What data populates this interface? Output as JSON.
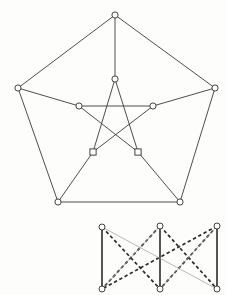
{
  "figure": {
    "background_color": "#fdfdfb",
    "colors": {
      "edge_solid": "#3a3a3a",
      "edge_heavy": "#2b2b2b",
      "edge_dashed": "#2b2b2b",
      "edge_faint": "#9a9a9a",
      "node_fill": "#ffffff",
      "node_stroke": "#2f2f2f"
    }
  },
  "petersen_graph": {
    "name": "petersen-graph",
    "node_radius": 3.1,
    "outer_nodes": [
      {
        "id": "o0",
        "label": "",
        "x": 115,
        "y": 15,
        "shape": "circle"
      },
      {
        "id": "o1",
        "label": "",
        "x": 215,
        "y": 88,
        "shape": "circle"
      },
      {
        "id": "o2",
        "label": "",
        "x": 180,
        "y": 202,
        "shape": "circle"
      },
      {
        "id": "o3",
        "label": "",
        "x": 58,
        "y": 202,
        "shape": "circle"
      },
      {
        "id": "o4",
        "label": "",
        "x": 18,
        "y": 88,
        "shape": "circle"
      }
    ],
    "inner_nodes": [
      {
        "id": "i0",
        "label": "",
        "x": 115,
        "y": 79,
        "shape": "circle"
      },
      {
        "id": "i1",
        "label": "",
        "x": 153,
        "y": 106,
        "shape": "circle"
      },
      {
        "id": "i2",
        "label": "",
        "x": 138,
        "y": 152,
        "shape": "square"
      },
      {
        "id": "i3",
        "label": "",
        "x": 93,
        "y": 152,
        "shape": "square"
      },
      {
        "id": "i4",
        "label": "",
        "x": 79,
        "y": 106,
        "shape": "circle"
      }
    ],
    "outer_edges": [
      {
        "from": "o0",
        "to": "o1",
        "style": "solid"
      },
      {
        "from": "o1",
        "to": "o2",
        "style": "solid"
      },
      {
        "from": "o2",
        "to": "o3",
        "style": "solid"
      },
      {
        "from": "o3",
        "to": "o4",
        "style": "solid"
      },
      {
        "from": "o4",
        "to": "o0",
        "style": "solid"
      }
    ],
    "spoke_edges": [
      {
        "from": "o0",
        "to": "i0",
        "style": "solid"
      },
      {
        "from": "o1",
        "to": "i1",
        "style": "solid"
      },
      {
        "from": "o2",
        "to": "i2",
        "style": "solid"
      },
      {
        "from": "o3",
        "to": "i3",
        "style": "solid"
      },
      {
        "from": "o4",
        "to": "i4",
        "style": "solid"
      }
    ],
    "pentagram_edges": [
      {
        "from": "i0",
        "to": "i2",
        "style": "solid"
      },
      {
        "from": "i2",
        "to": "i4",
        "style": "solid"
      },
      {
        "from": "i4",
        "to": "i1",
        "style": "solid"
      },
      {
        "from": "i1",
        "to": "i3",
        "style": "solid"
      },
      {
        "from": "i3",
        "to": "i0",
        "style": "solid"
      }
    ]
  },
  "bipartite_graph": {
    "name": "k33-graph",
    "node_radius": 3.0,
    "top_nodes": [
      {
        "id": "t0",
        "label": "",
        "x": 102,
        "y": 227
      },
      {
        "id": "t1",
        "label": "",
        "x": 160,
        "y": 226
      },
      {
        "id": "t2",
        "label": "",
        "x": 217,
        "y": 226
      }
    ],
    "bottom_nodes": [
      {
        "id": "b0",
        "label": "",
        "x": 102,
        "y": 289
      },
      {
        "id": "b1",
        "label": "",
        "x": 160,
        "y": 289
      },
      {
        "id": "b2",
        "label": "",
        "x": 217,
        "y": 289
      }
    ],
    "edges": [
      {
        "from": "t0",
        "to": "b0",
        "style": "heavy"
      },
      {
        "from": "t1",
        "to": "b1",
        "style": "heavy"
      },
      {
        "from": "t2",
        "to": "b2",
        "style": "heavy"
      },
      {
        "from": "t0",
        "to": "b1",
        "style": "dashed"
      },
      {
        "from": "t1",
        "to": "b2",
        "style": "dashed"
      },
      {
        "from": "t2",
        "to": "b0",
        "style": "dashed"
      },
      {
        "from": "t1",
        "to": "b0",
        "style": "dashed"
      },
      {
        "from": "t2",
        "to": "b1",
        "style": "dashed"
      },
      {
        "from": "t0",
        "to": "b2",
        "style": "faint"
      },
      {
        "from": "t1",
        "to": "b0",
        "style": "faint"
      },
      {
        "from": "t2",
        "to": "b1",
        "style": "faint"
      }
    ]
  }
}
